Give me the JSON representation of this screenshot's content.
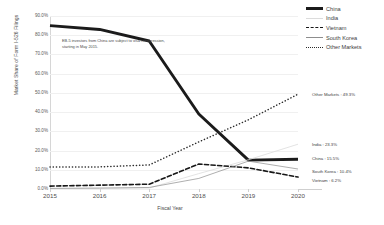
{
  "chart_data": {
    "type": "line",
    "title": "",
    "xlabel": "Fiscal Year",
    "ylabel": "Market Share of Form I-526 Filings",
    "x": [
      2015,
      2016,
      2017,
      2018,
      2019,
      2020
    ],
    "xtick_labels": [
      "2015",
      "2016",
      "2017",
      "2018",
      "2019",
      "2020"
    ],
    "ytick_labels": [
      "90.0%",
      "80.0%",
      "70.0%",
      "60.0%",
      "50.0%",
      "40.0%",
      "30.0%",
      "20.0%",
      "10.0%",
      "0.0%"
    ],
    "ylim": [
      0,
      90
    ],
    "ytick_values": [
      90,
      80,
      70,
      60,
      50,
      40,
      30,
      20,
      10,
      0
    ],
    "grid": true,
    "legend_position": "top-right",
    "series": [
      {
        "name": "China",
        "values": [
          85.0,
          83.0,
          77.0,
          39.0,
          15.0,
          15.5
        ],
        "style": "thick-solid",
        "color": "#1b1b1b"
      },
      {
        "name": "India",
        "values": [
          0.2,
          0.3,
          0.5,
          8.0,
          15.2,
          23.3
        ],
        "style": "thin-light",
        "color": "#dcdcdc"
      },
      {
        "name": "Vietnam",
        "values": [
          1.5,
          2.0,
          2.5,
          13.0,
          11.0,
          6.2
        ],
        "style": "dashed",
        "color": "#171717"
      },
      {
        "name": "South Korea",
        "values": [
          0.3,
          0.5,
          0.8,
          5.5,
          14.5,
          10.4
        ],
        "style": "thin-solid",
        "color": "#8d8d8d"
      },
      {
        "name": "Other Markets",
        "values": [
          11.5,
          11.5,
          12.5,
          24.5,
          36.0,
          49.3
        ],
        "style": "dotted",
        "color": "#2b2b2b"
      }
    ],
    "end_labels": [
      {
        "text": "Other Markets : 49.3%",
        "value": 49.3
      },
      {
        "text": "India : 23.3%",
        "value": 23.3
      },
      {
        "text": "China : 15.5%",
        "value": 15.5
      },
      {
        "text": "South Korea : 10.4%",
        "value": 10.4
      },
      {
        "text": "Vietnam : 6.2%",
        "value": 6.2
      }
    ],
    "annotations": [
      {
        "text": "EB-5 investors from China are subject to visa retrogression, starting in May 2015."
      }
    ]
  },
  "legend": {
    "items": [
      {
        "label": "China"
      },
      {
        "label": "India"
      },
      {
        "label": "Vietnam"
      },
      {
        "label": "South Korea"
      },
      {
        "label": "Other Markets"
      }
    ]
  }
}
